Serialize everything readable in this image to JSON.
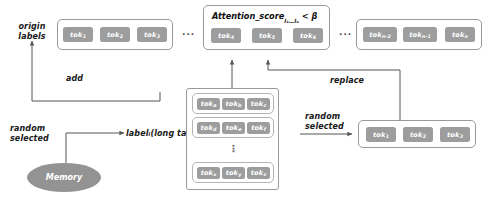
{
  "diagram": {
    "colors": {
      "token_fill": "#9d9d9d",
      "box_border": "#9a9a9a",
      "memory_fill": "#939393",
      "wire": "#555555",
      "text": "#111111"
    },
    "labels": {
      "origin_labels": "origin\nlabels",
      "random_selected_left": "random\nselected",
      "random_selected_right": "random\nselected",
      "add": "add",
      "replace": "replace",
      "memory": "Memory",
      "long_tail_label": "labelᵢ(long tail)",
      "attention_condition": "Attention_score",
      "attention_subscript": "l₁…lₒ",
      "attention_comparison": "< β",
      "ellipsis_1": "···",
      "ellipsis_2": "···",
      "vertical_ellipsis": "⋮"
    },
    "sequence": {
      "box_a_tokens": [
        {
          "base": "tok",
          "sub": "1"
        },
        {
          "base": "tok",
          "sub": "2"
        },
        {
          "base": "tok",
          "sub": "3"
        }
      ],
      "box_b_tokens": [
        {
          "base": "tok",
          "sub": "4"
        },
        {
          "base": "tok",
          "sub": "5"
        },
        {
          "base": "tok",
          "sub": "6"
        }
      ],
      "box_c_tokens": [
        {
          "base": "tok",
          "sub": "n-2"
        },
        {
          "base": "tok",
          "sub": "n-1"
        },
        {
          "base": "tok",
          "sub": "n"
        }
      ]
    },
    "candidate_grid": {
      "rows": [
        [
          {
            "base": "tok",
            "sub": "a"
          },
          {
            "base": "tok",
            "sub": "b"
          },
          {
            "base": "tok",
            "sub": "c"
          }
        ],
        [
          {
            "base": "tok",
            "sub": "d"
          },
          {
            "base": "tok",
            "sub": "e"
          },
          {
            "base": "tok",
            "sub": "f"
          }
        ],
        [
          {
            "base": "tok",
            "sub": "x"
          },
          {
            "base": "tok",
            "sub": "y"
          },
          {
            "base": "tok",
            "sub": "z"
          }
        ]
      ]
    },
    "result": {
      "tokens": [
        {
          "base": "tok",
          "sub": "1"
        },
        {
          "base": "tok",
          "sub": "2"
        },
        {
          "base": "tok",
          "sub": "3"
        }
      ]
    }
  }
}
